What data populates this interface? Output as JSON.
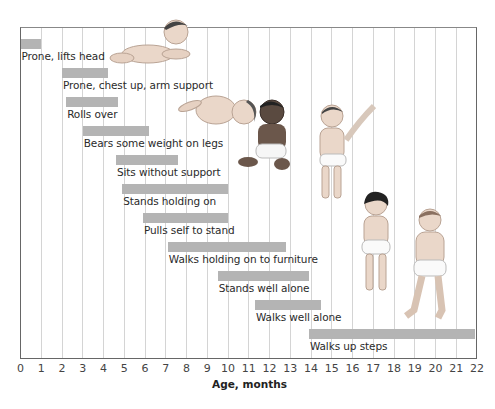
{
  "chart_data": {
    "type": "bar",
    "subtype": "horizontal-range (gantt)",
    "title": "",
    "xlabel": "Age, months",
    "ylabel": "",
    "xlim": [
      0,
      22
    ],
    "x_ticks": [
      "0",
      "1",
      "2",
      "3",
      "4",
      "5",
      "6",
      "7",
      "8",
      "9",
      "10",
      "11",
      "12",
      "13",
      "14",
      "15",
      "16",
      "17",
      "18",
      "19",
      "20",
      "21",
      "22"
    ],
    "grid": "vertical lines at each month",
    "legend": null,
    "bar_color": "#b4b4b4",
    "milestones": [
      {
        "label": "Prone, lifts head",
        "start": 0,
        "end": 1
      },
      {
        "label": "Prone, chest up, arm support",
        "start": 2,
        "end": 4.2
      },
      {
        "label": "Rolls over",
        "start": 2.2,
        "end": 4.7
      },
      {
        "label": "Bears some weight on legs",
        "start": 3,
        "end": 6.2
      },
      {
        "label": "Sits without support",
        "start": 4.6,
        "end": 7.6
      },
      {
        "label": "Stands holding on",
        "start": 4.9,
        "end": 10
      },
      {
        "label": "Pulls self to stand",
        "start": 5.9,
        "end": 10
      },
      {
        "label": "Walks holding on to furniture",
        "start": 7.1,
        "end": 12.8
      },
      {
        "label": "Stands well alone",
        "start": 9.5,
        "end": 13.9
      },
      {
        "label": "Walks well alone",
        "start": 11.3,
        "end": 14.5
      },
      {
        "label": "Walks up steps",
        "start": 13.9,
        "end": 21.9
      }
    ],
    "illustrations": [
      "baby prone lifting head",
      "baby rolling over",
      "baby sitting",
      "baby standing with support",
      "baby standing alone",
      "baby walking"
    ]
  }
}
